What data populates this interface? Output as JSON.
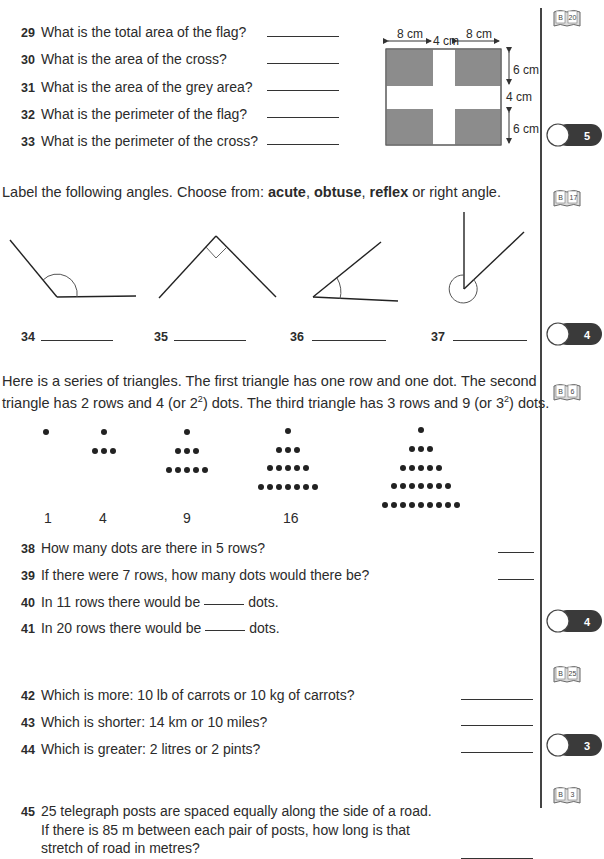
{
  "section_flag": {
    "questions": [
      {
        "num": "29",
        "text": "What is the total area of the flag?"
      },
      {
        "num": "30",
        "text": "What is the area of the cross?"
      },
      {
        "num": "31",
        "text": "What is the area of the grey area?"
      },
      {
        "num": "32",
        "text": "What is the perimeter of the flag?"
      },
      {
        "num": "33",
        "text": "What is the perimeter of the cross?"
      }
    ],
    "diagram": {
      "top_labels": [
        "8 cm",
        "4 cm",
        "8 cm"
      ],
      "side_labels": [
        "6 cm",
        "4 cm",
        "6 cm"
      ],
      "grey_color": "#8c8c8c"
    },
    "book_ref": {
      "letter": "B",
      "page": "20"
    },
    "score": "5"
  },
  "section_angles": {
    "instruction_prefix": "Label the following angles. Choose from: ",
    "opt1": "acute",
    "sep1": ", ",
    "opt2": "obtuse",
    "sep2": ", ",
    "opt3": "reflex",
    "instruction_suffix": " or right angle.",
    "questions": [
      {
        "num": "34"
      },
      {
        "num": "35"
      },
      {
        "num": "36"
      },
      {
        "num": "37"
      }
    ],
    "book_ref": {
      "letter": "B",
      "page": "17"
    },
    "score": "4"
  },
  "section_triangles": {
    "intro_line1": "Here is a series of triangles. The first triangle has one row and one dot. The second",
    "intro_line2_a": "triangle has 2 rows and 4 (or 2",
    "intro_line2_sup1": "2",
    "intro_line2_b": ") dots. The third triangle has 3 rows and 9 (or 3",
    "intro_line2_sup2": "2",
    "intro_line2_c": ") dots.",
    "counts": [
      "1",
      "4",
      "9",
      "16"
    ],
    "questions": [
      {
        "num": "38",
        "text": "How many dots are there in 5 rows?"
      },
      {
        "num": "39",
        "text": "If there were 7 rows, how many dots would there be?"
      },
      {
        "num": "40",
        "text_a": "In 11 rows there would be",
        "text_b": "dots."
      },
      {
        "num": "41",
        "text_a": "In 20 rows there would be",
        "text_b": "dots."
      }
    ],
    "book_ref": {
      "letter": "B",
      "page": "6"
    },
    "score": "4"
  },
  "section_units": {
    "questions": [
      {
        "num": "42",
        "text": "Which is more: 10 lb of carrots or 10 kg of carrots?"
      },
      {
        "num": "43",
        "text": "Which is shorter: 14 km or 10 miles?"
      },
      {
        "num": "44",
        "text": "Which is greater: 2 litres or 2 pints?"
      }
    ],
    "book_ref": {
      "letter": "B",
      "page": "25"
    },
    "score": "3"
  },
  "section_posts": {
    "num": "45",
    "line1": "25 telegraph posts are spaced equally along the side of a road.",
    "line2": "If there is 85 m between each pair of posts, how long is that",
    "line3": "stretch of road in metres?",
    "book_ref": {
      "letter": "B",
      "page": "3"
    }
  }
}
